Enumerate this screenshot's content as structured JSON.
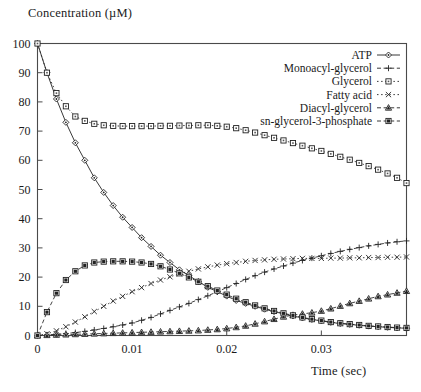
{
  "chart_data": {
    "type": "line",
    "title": "",
    "ylabel": "Concentration (µM)",
    "xlabel": "Time (sec)",
    "xlim": [
      0,
      0.039
    ],
    "ylim": [
      0,
      100
    ],
    "xticks": [
      0,
      0.01,
      0.02,
      0.03
    ],
    "xtick_labels": [
      "0",
      "0.01",
      "0.02",
      "0.03"
    ],
    "yticks": [
      0,
      10,
      20,
      30,
      40,
      50,
      60,
      70,
      80,
      90,
      100
    ],
    "ytick_labels": [
      "0",
      "10",
      "20",
      "30",
      "40",
      "50",
      "60",
      "70",
      "80",
      "90",
      "100"
    ],
    "grid": false,
    "legend_position": "top-right",
    "x": [
      0,
      0.001,
      0.002,
      0.003,
      0.004,
      0.005,
      0.006,
      0.007,
      0.008,
      0.009,
      0.01,
      0.011,
      0.012,
      0.013,
      0.014,
      0.015,
      0.016,
      0.017,
      0.018,
      0.019,
      0.02,
      0.021,
      0.022,
      0.023,
      0.024,
      0.025,
      0.026,
      0.027,
      0.028,
      0.029,
      0.03,
      0.031,
      0.032,
      0.033,
      0.034,
      0.035,
      0.036,
      0.037,
      0.038,
      0.039
    ],
    "series": [
      {
        "name": "ATP",
        "marker": "diamond",
        "linestyle": "solid",
        "values": [
          100,
          90,
          81,
          73,
          66,
          60,
          54,
          49,
          44.5,
          40.5,
          37,
          33.5,
          30.5,
          27.5,
          25,
          22.5,
          20.5,
          18.5,
          16.5,
          15,
          13.5,
          12,
          11,
          10,
          9,
          8.2,
          7.4,
          6.7,
          6,
          5.5,
          5,
          4.5,
          4.1,
          3.8,
          3.5,
          3.2,
          3,
          2.8,
          2.6,
          2.5
        ]
      },
      {
        "name": "Monoacyl-glycerol",
        "marker": "plus",
        "linestyle": "dashed",
        "values": [
          0,
          0.2,
          0.4,
          0.7,
          1,
          1.4,
          1.9,
          2.4,
          3,
          3.6,
          4.3,
          5.2,
          6.2,
          7.4,
          8.6,
          9.8,
          11,
          12.3,
          13.6,
          15,
          16.4,
          17.8,
          19.2,
          20.5,
          21.7,
          22.8,
          23.8,
          24.8,
          25.7,
          26.5,
          27.3,
          28.1,
          28.8,
          29.5,
          30.1,
          30.7,
          31.2,
          31.7,
          32.1,
          32.4
        ]
      },
      {
        "name": "Glycerol",
        "marker": "square",
        "linestyle": "dotted",
        "values": [
          100,
          90,
          83,
          78.5,
          75,
          73.5,
          72.5,
          72,
          71.8,
          71.7,
          71.7,
          71.7,
          71.7,
          71.8,
          71.8,
          71.9,
          71.9,
          72,
          72,
          71.8,
          71.5,
          71,
          70.3,
          69.5,
          68.6,
          67.7,
          66.8,
          65.9,
          65,
          64.1,
          63.2,
          62.2,
          61.2,
          60.2,
          59.1,
          58,
          56.8,
          55.5,
          54,
          52.2
        ]
      },
      {
        "name": "Fatty acid",
        "marker": "cross",
        "linestyle": "dotted",
        "values": [
          0,
          0.6,
          1.6,
          3,
          4.6,
          6.4,
          8.2,
          10,
          11.8,
          13.4,
          15,
          16.4,
          17.8,
          19,
          20.1,
          21.1,
          22,
          22.8,
          23.5,
          24.1,
          24.6,
          25,
          25.4,
          25.7,
          25.9,
          26.1,
          26.2,
          26.3,
          26.4,
          26.4,
          26.4,
          26.5,
          26.5,
          26.6,
          26.6,
          26.7,
          26.7,
          26.8,
          26.8,
          26.9
        ]
      },
      {
        "name": "Diacyl-glycerol",
        "marker": "triangle",
        "linestyle": "dashed",
        "values": [
          0,
          0.1,
          0.2,
          0.3,
          0.4,
          0.5,
          0.6,
          0.7,
          0.8,
          0.9,
          1,
          1.1,
          1.2,
          1.3,
          1.4,
          1.5,
          1.6,
          1.7,
          1.9,
          2.1,
          2.4,
          2.8,
          3.3,
          4,
          4.8,
          5.6,
          6.4,
          7,
          7.4,
          7.8,
          8.4,
          9.2,
          10.1,
          11,
          11.8,
          12.6,
          13.4,
          14,
          14.6,
          15.2
        ]
      },
      {
        "name": "sn-glycerol-3-phosphate",
        "marker": "filled-square",
        "linestyle": "dashed",
        "values": [
          0,
          8,
          14.5,
          19,
          22,
          24,
          25,
          25.3,
          25.4,
          25.4,
          25.3,
          25,
          24.5,
          23.7,
          22.6,
          21.3,
          19.9,
          18.4,
          16.9,
          15.4,
          14,
          12.6,
          11.4,
          10.3,
          9.3,
          8.4,
          7.6,
          6.9,
          6.2,
          5.6,
          5.1,
          4.6,
          4.2,
          3.9,
          3.6,
          3.3,
          3.1,
          2.9,
          2.7,
          2.6
        ]
      }
    ]
  }
}
